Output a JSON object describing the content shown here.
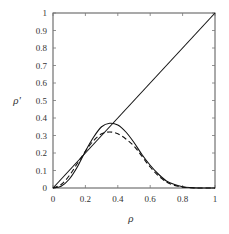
{
  "chart_data": {
    "type": "line",
    "title": "",
    "xlabel": "ρ",
    "ylabel": "ρ'",
    "xlim": [
      0,
      1
    ],
    "ylim": [
      0,
      1
    ],
    "grid": false,
    "legend": null,
    "x_ticks": [
      "0",
      "0.2",
      "0.4",
      "0.6",
      "0.8",
      "1"
    ],
    "y_ticks": [
      "0",
      "0.1",
      "0.2",
      "0.3",
      "0.4",
      "0.5",
      "0.6",
      "0.7",
      "0.8",
      "0.9",
      "1"
    ],
    "series": [
      {
        "name": "identity",
        "style": "solid",
        "x": [
          0,
          1
        ],
        "y": [
          0,
          1
        ]
      },
      {
        "name": "solid-curve",
        "style": "solid",
        "x": [
          0,
          0.05,
          0.1,
          0.15,
          0.2,
          0.25,
          0.3,
          0.35,
          0.4,
          0.45,
          0.5,
          0.55,
          0.6,
          0.65,
          0.7,
          0.75,
          0.8,
          0.85,
          0.9,
          1.0
        ],
        "y": [
          0,
          0.01,
          0.05,
          0.12,
          0.21,
          0.29,
          0.35,
          0.37,
          0.36,
          0.32,
          0.26,
          0.19,
          0.13,
          0.08,
          0.04,
          0.02,
          0.007,
          0.002,
          0.0,
          0.0
        ]
      },
      {
        "name": "dashed-curve",
        "style": "dashed",
        "x": [
          0,
          0.05,
          0.1,
          0.15,
          0.2,
          0.25,
          0.3,
          0.35,
          0.4,
          0.45,
          0.5,
          0.55,
          0.6,
          0.65,
          0.7,
          0.75,
          0.8,
          0.85,
          0.9,
          1.0
        ],
        "y": [
          0,
          0.02,
          0.07,
          0.14,
          0.21,
          0.27,
          0.31,
          0.32,
          0.31,
          0.28,
          0.24,
          0.18,
          0.12,
          0.07,
          0.035,
          0.015,
          0.005,
          0.001,
          0.0,
          0.0
        ]
      }
    ]
  }
}
